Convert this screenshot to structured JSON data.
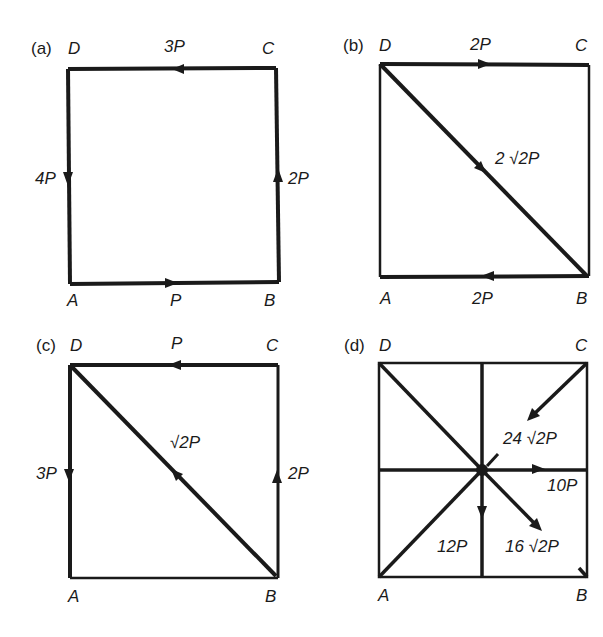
{
  "figure": {
    "panels": [
      {
        "tag": "(a)",
        "vertices": {
          "A": "A",
          "B": "B",
          "C": "C",
          "D": "D"
        },
        "forces": [
          {
            "edge": "AB",
            "label": "P",
            "direction": "A→B"
          },
          {
            "edge": "BC",
            "label": "2P",
            "direction": "B→C"
          },
          {
            "edge": "CD",
            "label": "3P",
            "direction": "C→D"
          },
          {
            "edge": "DA",
            "label": "4P",
            "direction": "D→A"
          }
        ]
      },
      {
        "tag": "(b)",
        "vertices": {
          "A": "A",
          "B": "B",
          "C": "C",
          "D": "D"
        },
        "forces": [
          {
            "edge": "DC",
            "label": "2P",
            "direction": "D→C"
          },
          {
            "edge": "BA",
            "label": "2P",
            "direction": "B→A"
          },
          {
            "edge": "DB",
            "label": "2 √2P",
            "direction": "D→B"
          }
        ]
      },
      {
        "tag": "(c)",
        "vertices": {
          "A": "A",
          "B": "B",
          "C": "C",
          "D": "D"
        },
        "forces": [
          {
            "edge": "CD",
            "label": "P",
            "direction": "C→D"
          },
          {
            "edge": "DA",
            "label": "3P",
            "direction": "D→A"
          },
          {
            "edge": "BC",
            "label": "2P",
            "direction": "B→C"
          },
          {
            "edge": "BD",
            "label": "√2P",
            "direction": "B→D"
          }
        ]
      },
      {
        "tag": "(d)",
        "vertices": {
          "A": "A",
          "B": "B",
          "C": "C",
          "D": "D"
        },
        "forces": [
          {
            "edge": "C→centre",
            "label": "24 √2P",
            "direction": "toward centre"
          },
          {
            "edge": "centre→right",
            "label": "10P",
            "direction": "rightward"
          },
          {
            "edge": "centre→bottom",
            "label": "12P",
            "direction": "downward"
          },
          {
            "edge": "centre→B",
            "label": "16 √2P",
            "direction": "toward B"
          }
        ]
      }
    ]
  },
  "labels": {
    "a": {
      "tag": "(a)",
      "D": "D",
      "C": "C",
      "A": "A",
      "B": "B",
      "top": "3P",
      "left": "4P",
      "right": "2P",
      "bottom": "P"
    },
    "b": {
      "tag": "(b)",
      "D": "D",
      "C": "C",
      "A": "A",
      "B": "B",
      "top": "2P",
      "diag": "2 √2P",
      "bottom": "2P"
    },
    "c": {
      "tag": "(c)",
      "D": "D",
      "C": "C",
      "A": "A",
      "B": "B",
      "top": "P",
      "left": "3P",
      "diag": "√2P",
      "right": "2P"
    },
    "d": {
      "tag": "(d)",
      "D": "D",
      "C": "C",
      "A": "A",
      "B": "B",
      "f1": "24 √2P",
      "f2": "10P",
      "f3": "12P",
      "f4": "16 √2P"
    }
  },
  "colors": {
    "ink": "#1a1a1a",
    "background": "#ffffff"
  }
}
